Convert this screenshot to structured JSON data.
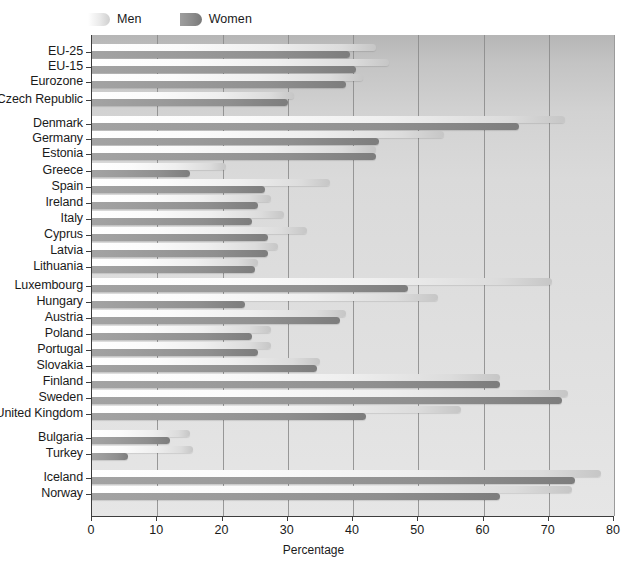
{
  "chart_data": {
    "type": "bar",
    "orientation": "horizontal",
    "title": "",
    "xlabel": "Percentage",
    "ylabel": "",
    "xlim": [
      0,
      80
    ],
    "xticks": [
      0,
      10,
      20,
      30,
      40,
      50,
      60,
      70,
      80
    ],
    "grid": true,
    "legend_position": "top-left",
    "categories": [
      "EU-25",
      "EU-15",
      "Eurozone",
      "Czech Republic",
      "Denmark",
      "Germany",
      "Estonia",
      "Greece",
      "Spain",
      "Ireland",
      "Italy",
      "Cyprus",
      "Latvia",
      "Lithuania",
      "Luxembourg",
      "Hungary",
      "Austria",
      "Poland",
      "Portugal",
      "Slovakia",
      "Finland",
      "Sweden",
      "United Kingdom",
      "Bulgaria",
      "Turkey",
      "Iceland",
      "Norway"
    ],
    "series": [
      {
        "name": "Men",
        "color": "#ededed",
        "values": [
          43.5,
          45.5,
          41.5,
          31.0,
          72.5,
          54.0,
          43.5,
          20.5,
          36.5,
          27.5,
          29.5,
          33.0,
          28.5,
          25.5,
          70.5,
          53.0,
          39.0,
          27.5,
          27.5,
          35.0,
          62.5,
          73.0,
          56.5,
          15.0,
          15.5,
          78.0,
          73.5
        ],
        "unit": "%"
      },
      {
        "name": "Women",
        "color": "#919191",
        "values": [
          39.5,
          40.5,
          39.0,
          30.0,
          65.5,
          44.0,
          43.5,
          15.0,
          26.5,
          25.5,
          24.5,
          27.0,
          27.0,
          25.0,
          48.5,
          23.5,
          38.0,
          24.5,
          25.5,
          34.5,
          62.5,
          72.0,
          42.0,
          12.0,
          5.5,
          74.0,
          62.5
        ],
        "unit": "%"
      }
    ]
  },
  "legend": {
    "items": [
      {
        "label": "Men",
        "swatch": "men-swatch"
      },
      {
        "label": "Women",
        "swatch": "women-swatch"
      }
    ]
  },
  "axis": {
    "x_title": "Percentage",
    "tick_labels": [
      "0",
      "10",
      "20",
      "30",
      "40",
      "50",
      "60",
      "70",
      "80"
    ]
  }
}
